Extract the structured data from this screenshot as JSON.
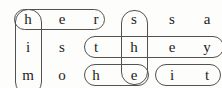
{
  "puzzle": {
    "type": "word-search-grid",
    "rows": 3,
    "cols": 6,
    "grid": [
      [
        "h",
        "e",
        "r",
        "s",
        "s",
        "a"
      ],
      [
        "i",
        "s",
        "t",
        "h",
        "e",
        "y"
      ],
      [
        "m",
        "o",
        "h",
        "e",
        "i",
        "t"
      ]
    ],
    "cells": {
      "r0c0": "h",
      "r0c1": "e",
      "r0c2": "r",
      "r0c3": "s",
      "r0c4": "s",
      "r0c5": "a",
      "r1c0": "i",
      "r1c1": "s",
      "r1c2": "t",
      "r1c3": "h",
      "r1c4": "e",
      "r1c5": "y",
      "r2c0": "m",
      "r2c1": "o",
      "r2c2": "h",
      "r2c3": "e",
      "r2c4": "i",
      "r2c5": "t"
    },
    "circled_words": [
      {
        "id": "her",
        "word": "her",
        "orientation": "horizontal",
        "row": 0,
        "col_start": 0,
        "col_end": 2
      },
      {
        "id": "him",
        "word": "him",
        "orientation": "vertical",
        "col": 0,
        "row_start": 0,
        "row_end": 2
      },
      {
        "id": "she",
        "word": "she",
        "orientation": "vertical",
        "col": 3,
        "row_start": 0,
        "row_end": 2
      },
      {
        "id": "they",
        "word": "they",
        "orientation": "horizontal",
        "row": 1,
        "col_start": 2,
        "col_end": 5
      },
      {
        "id": "he",
        "word": "he",
        "orientation": "horizontal",
        "row": 2,
        "col_start": 2,
        "col_end": 3
      },
      {
        "id": "it",
        "word": "it",
        "orientation": "horizontal",
        "row": 2,
        "col_start": 4,
        "col_end": 5
      }
    ],
    "colors": {
      "background": "#fdfdfc",
      "letter": "#1d1c1a",
      "oval_stroke": "#55524e"
    }
  }
}
